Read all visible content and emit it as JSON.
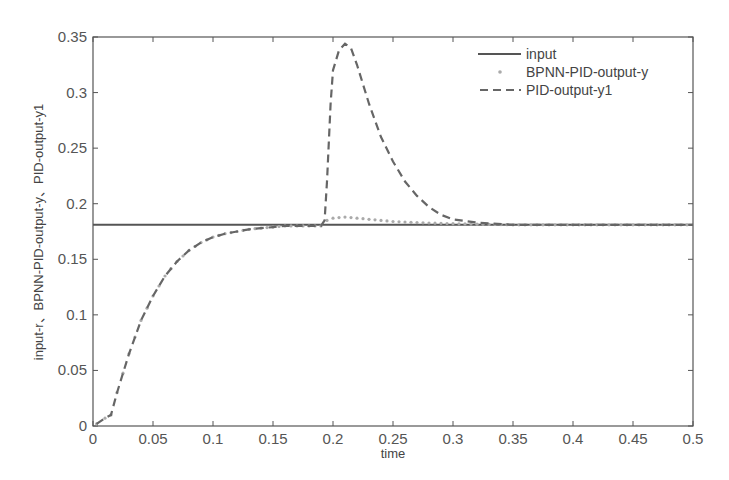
{
  "chart_data": {
    "type": "line",
    "title": "",
    "xlabel": "time",
    "ylabel": "input-r、BPNN-PID-output-y、PID-output-y1",
    "xlim": [
      0,
      0.5
    ],
    "ylim": [
      0,
      0.35
    ],
    "grid": false,
    "legend_position": "upper right (inside)",
    "x_ticks": [
      "0",
      "0.05",
      "0.1",
      "0.15",
      "0.2",
      "0.25",
      "0.3",
      "0.35",
      "0.4",
      "0.45",
      "0.5"
    ],
    "y_ticks": [
      "0",
      "0.05",
      "0.1",
      "0.15",
      "0.2",
      "0.25",
      "0.3",
      "0.35"
    ],
    "series": [
      {
        "name": "input",
        "style": "solid",
        "color": "#555555",
        "x": [
          0,
          0.5
        ],
        "values": [
          0.181,
          0.181
        ]
      },
      {
        "name": "BPNN-PID-output-y",
        "style": "dotted-markers",
        "color": "#aaaaaa",
        "x": [
          0.003,
          0.01,
          0.015,
          0.02,
          0.03,
          0.04,
          0.05,
          0.06,
          0.07,
          0.08,
          0.09,
          0.1,
          0.11,
          0.12,
          0.13,
          0.14,
          0.15,
          0.16,
          0.17,
          0.18,
          0.19,
          0.195,
          0.2,
          0.21,
          0.22,
          0.23,
          0.24,
          0.25,
          0.27,
          0.3,
          0.35,
          0.4,
          0.45,
          0.5
        ],
        "values": [
          0.002,
          0.007,
          0.01,
          0.03,
          0.065,
          0.095,
          0.117,
          0.135,
          0.148,
          0.158,
          0.165,
          0.17,
          0.173,
          0.175,
          0.177,
          0.178,
          0.179,
          0.18,
          0.18,
          0.18,
          0.18,
          0.185,
          0.187,
          0.188,
          0.187,
          0.186,
          0.185,
          0.184,
          0.183,
          0.182,
          0.181,
          0.181,
          0.181,
          0.181
        ]
      },
      {
        "name": "PID-output-y1",
        "style": "dashed",
        "color": "#666666",
        "x": [
          0.003,
          0.01,
          0.015,
          0.02,
          0.03,
          0.04,
          0.05,
          0.06,
          0.07,
          0.08,
          0.09,
          0.1,
          0.11,
          0.12,
          0.13,
          0.14,
          0.15,
          0.16,
          0.17,
          0.18,
          0.19,
          0.193,
          0.195,
          0.198,
          0.2,
          0.205,
          0.21,
          0.215,
          0.22,
          0.23,
          0.24,
          0.25,
          0.26,
          0.27,
          0.28,
          0.29,
          0.3,
          0.32,
          0.35,
          0.4,
          0.45,
          0.5
        ],
        "values": [
          0.002,
          0.007,
          0.01,
          0.03,
          0.065,
          0.095,
          0.117,
          0.135,
          0.148,
          0.158,
          0.165,
          0.17,
          0.173,
          0.175,
          0.177,
          0.178,
          0.179,
          0.18,
          0.18,
          0.18,
          0.18,
          0.185,
          0.22,
          0.29,
          0.32,
          0.338,
          0.344,
          0.34,
          0.325,
          0.29,
          0.26,
          0.238,
          0.22,
          0.207,
          0.197,
          0.19,
          0.186,
          0.183,
          0.181,
          0.181,
          0.181,
          0.181
        ]
      }
    ]
  },
  "legend": {
    "items": [
      {
        "label": "input"
      },
      {
        "label": "BPNN-PID-output-y"
      },
      {
        "label": "PID-output-y1"
      }
    ]
  },
  "axes": {
    "xlabel": "time",
    "ylabel": "input-r、BPNN-PID-output-y、PID-output-y1"
  }
}
